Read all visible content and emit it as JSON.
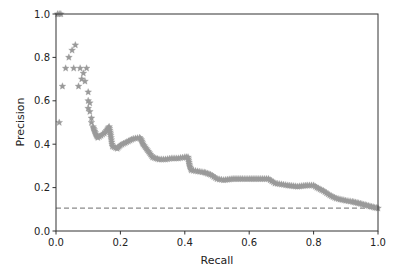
{
  "chart_data": {
    "type": "scatter",
    "title": "",
    "xlabel": "Recall",
    "ylabel": "Precision",
    "xlim": [
      0.0,
      1.0
    ],
    "ylim": [
      0.0,
      1.0
    ],
    "xticks": [
      "0.0",
      "0.2",
      "0.4",
      "0.6",
      "0.8",
      "1.0"
    ],
    "yticks": [
      "0.0",
      "0.2",
      "0.4",
      "0.6",
      "0.8",
      "1.0"
    ],
    "grid": false,
    "legend": null,
    "marker": "star",
    "marker_color": "#9a9a9a",
    "baseline": {
      "style": "dashed",
      "color": "#8a8a8a",
      "y": 0.105,
      "label": ""
    },
    "series": [
      {
        "name": "precision-recall",
        "points": [
          [
            0.005,
            1.0
          ],
          [
            0.01,
            1.0
          ],
          [
            0.015,
            1.0
          ],
          [
            0.01,
            0.5
          ],
          [
            0.02,
            0.667
          ],
          [
            0.03,
            0.75
          ],
          [
            0.04,
            0.8
          ],
          [
            0.05,
            0.833
          ],
          [
            0.06,
            0.857
          ],
          [
            0.055,
            0.75
          ],
          [
            0.075,
            0.75
          ],
          [
            0.07,
            0.667
          ],
          [
            0.08,
            0.7
          ],
          [
            0.085,
            0.727
          ],
          [
            0.09,
            0.69
          ],
          [
            0.095,
            0.75
          ],
          [
            0.1,
            0.64
          ],
          [
            0.1,
            0.6
          ],
          [
            0.105,
            0.59
          ],
          [
            0.1,
            0.565
          ],
          [
            0.105,
            0.55
          ],
          [
            0.11,
            0.52
          ],
          [
            0.11,
            0.5
          ],
          [
            0.115,
            0.48
          ],
          [
            0.12,
            0.46
          ],
          [
            0.125,
            0.44
          ],
          [
            0.13,
            0.43
          ],
          [
            0.14,
            0.44
          ],
          [
            0.15,
            0.45
          ],
          [
            0.16,
            0.47
          ],
          [
            0.165,
            0.48
          ],
          [
            0.17,
            0.44
          ],
          [
            0.175,
            0.39
          ],
          [
            0.19,
            0.38
          ],
          [
            0.2,
            0.395
          ],
          [
            0.22,
            0.41
          ],
          [
            0.24,
            0.425
          ],
          [
            0.26,
            0.43
          ],
          [
            0.265,
            0.42
          ],
          [
            0.27,
            0.4
          ],
          [
            0.28,
            0.38
          ],
          [
            0.29,
            0.36
          ],
          [
            0.3,
            0.34
          ],
          [
            0.32,
            0.33
          ],
          [
            0.34,
            0.33
          ],
          [
            0.36,
            0.335
          ],
          [
            0.38,
            0.335
          ],
          [
            0.4,
            0.34
          ],
          [
            0.41,
            0.34
          ],
          [
            0.415,
            0.3
          ],
          [
            0.42,
            0.28
          ],
          [
            0.44,
            0.275
          ],
          [
            0.46,
            0.27
          ],
          [
            0.48,
            0.26
          ],
          [
            0.5,
            0.24
          ],
          [
            0.52,
            0.235
          ],
          [
            0.55,
            0.24
          ],
          [
            0.58,
            0.24
          ],
          [
            0.6,
            0.24
          ],
          [
            0.63,
            0.24
          ],
          [
            0.66,
            0.24
          ],
          [
            0.67,
            0.23
          ],
          [
            0.68,
            0.22
          ],
          [
            0.7,
            0.215
          ],
          [
            0.72,
            0.21
          ],
          [
            0.75,
            0.205
          ],
          [
            0.78,
            0.21
          ],
          [
            0.8,
            0.21
          ],
          [
            0.81,
            0.2
          ],
          [
            0.83,
            0.185
          ],
          [
            0.85,
            0.165
          ],
          [
            0.87,
            0.15
          ],
          [
            0.9,
            0.14
          ],
          [
            0.92,
            0.135
          ],
          [
            0.94,
            0.128
          ],
          [
            0.96,
            0.12
          ],
          [
            0.98,
            0.112
          ],
          [
            0.99,
            0.108
          ],
          [
            1.0,
            0.105
          ]
        ]
      }
    ]
  }
}
